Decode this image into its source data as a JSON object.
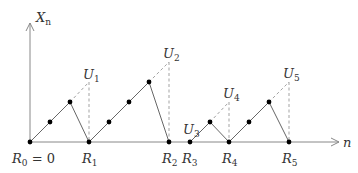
{
  "diagram": {
    "axes": {
      "y_label": "X",
      "y_label_sub": "n",
      "x_label": "n",
      "color": "#888888"
    },
    "colors": {
      "line": "#666666",
      "dashed": "#999999",
      "point": "#000000",
      "text": "#333333"
    },
    "renewal_points": [
      {
        "label": "R",
        "sub": "0",
        "suffix": " = 0"
      },
      {
        "label": "R",
        "sub": "1",
        "suffix": ""
      },
      {
        "label": "R",
        "sub": "2",
        "suffix": ""
      },
      {
        "label": "R",
        "sub": "3",
        "suffix": ""
      },
      {
        "label": "R",
        "sub": "4",
        "suffix": ""
      },
      {
        "label": "R",
        "sub": "5",
        "suffix": ""
      }
    ],
    "u_labels": [
      {
        "label": "U",
        "sub": "1"
      },
      {
        "label": "U",
        "sub": "2"
      },
      {
        "label": "U",
        "sub": "3"
      },
      {
        "label": "U",
        "sub": "4"
      },
      {
        "label": "U",
        "sub": "5"
      }
    ]
  }
}
